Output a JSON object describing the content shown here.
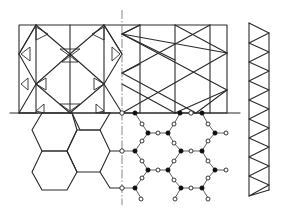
{
  "figure": {
    "colors": {
      "line": "#2a2a2a",
      "axis": "#6a6a6a",
      "filled_atom": "#111111",
      "open_atom": "#ffffff",
      "background": "#ffffff"
    },
    "panels": [
      {
        "id": "kagome-frame",
        "label": ""
      },
      {
        "id": "honeycomb",
        "label": ""
      },
      {
        "id": "ball-stick-lattice",
        "label": ""
      },
      {
        "id": "truss-strip",
        "label": ""
      }
    ],
    "symmetry_axis": {
      "style": "dash-dot",
      "orientation": "vertical"
    },
    "atoms": {
      "filled_label": "",
      "open_label": ""
    }
  }
}
